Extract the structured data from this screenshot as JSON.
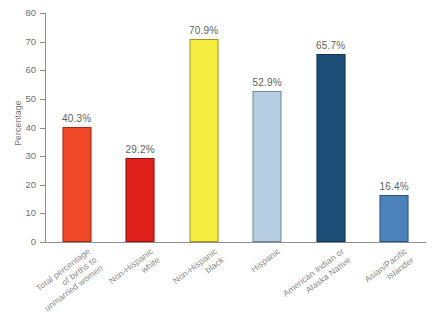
{
  "chart_data": {
    "type": "bar",
    "title": "",
    "xlabel": "",
    "ylabel": "Percentage",
    "ylim": [
      0,
      80
    ],
    "ytick_step": 10,
    "yticks": [
      0,
      10,
      20,
      30,
      40,
      50,
      60,
      70,
      80
    ],
    "grid": false,
    "legend": "none",
    "value_suffix": "%",
    "categories": [
      "Total percentage of births to unmarried women",
      "Non-Hispanic white",
      "Non-Hispanic black",
      "Hispanic",
      "American Indian or Alaska Native",
      "Asian/Pacific Islander"
    ],
    "values": [
      40.3,
      29.2,
      70.9,
      52.9,
      65.7,
      16.4
    ],
    "value_labels": [
      "40.3%",
      "29.2%",
      "70.9%",
      "52.9%",
      "65.7%",
      "16.4%"
    ],
    "bar_colors": [
      "#F0492A",
      "#E0201A",
      "#F6EB3F",
      "#B5CEE4",
      "#1D4E78",
      "#4C82BC"
    ],
    "bars": [
      {
        "category": "Total percentage of births to unmarried women",
        "category_lines": [
          "Total percentage",
          "of births to",
          "unmarried women"
        ],
        "value": 40.3,
        "label": "40.3%",
        "color": "#F0492A"
      },
      {
        "category": "Non-Hispanic white",
        "category_lines": [
          "Non-Hispanic",
          "white"
        ],
        "value": 29.2,
        "label": "29.2%",
        "color": "#E0201A"
      },
      {
        "category": "Non-Hispanic black",
        "category_lines": [
          "Non-Hispanic",
          "black"
        ],
        "value": 70.9,
        "label": "70.9%",
        "color": "#F6EB3F"
      },
      {
        "category": "Hispanic",
        "category_lines": [
          "Hispanic"
        ],
        "value": 52.9,
        "label": "52.9%",
        "color": "#B5CEE4"
      },
      {
        "category": "American Indian or Alaska Native",
        "category_lines": [
          "American Indian or",
          "Alaska Native"
        ],
        "value": 65.7,
        "label": "65.7%",
        "color": "#1D4E78"
      },
      {
        "category": "Asian/Pacific Islander",
        "category_lines": [
          "Asian/Pacific",
          "Islander"
        ],
        "value": 16.4,
        "label": "16.4%",
        "color": "#4C82BC"
      }
    ]
  },
  "axis": {
    "y_title": "Percentage",
    "y_labels": [
      "80",
      "70",
      "60",
      "50",
      "40",
      "30",
      "20",
      "10",
      "0"
    ]
  }
}
